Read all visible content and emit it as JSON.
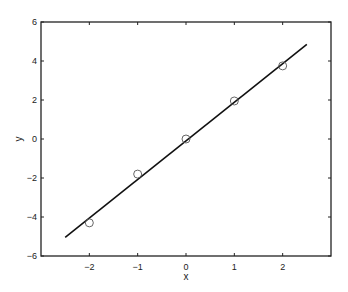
{
  "chart_data": {
    "type": "scatter",
    "title": "",
    "xlabel": "x",
    "ylabel": "y",
    "xlim": [
      -3,
      3
    ],
    "ylim": [
      -6,
      6
    ],
    "grid": false,
    "legend": null,
    "x_ticks": [
      -2,
      -1,
      0,
      1,
      2
    ],
    "x_tick_labels": [
      "−2",
      "−1",
      "0",
      "1",
      "2"
    ],
    "y_ticks": [
      -6,
      -4,
      -2,
      0,
      2,
      4,
      6
    ],
    "y_tick_labels": [
      "−6",
      "−4",
      "−2",
      "0",
      "2",
      "4",
      "6"
    ],
    "series": [
      {
        "name": "data",
        "kind": "scatter",
        "marker": "open-circle",
        "color": "#555555",
        "x": [
          -2,
          -1,
          0,
          1,
          2
        ],
        "y": [
          -4.3,
          -1.8,
          0.0,
          1.95,
          3.75
        ]
      },
      {
        "name": "fit",
        "kind": "line",
        "color": "#111111",
        "x": [
          -2.5,
          2.5
        ],
        "y": [
          -5.05,
          4.85
        ]
      }
    ]
  }
}
